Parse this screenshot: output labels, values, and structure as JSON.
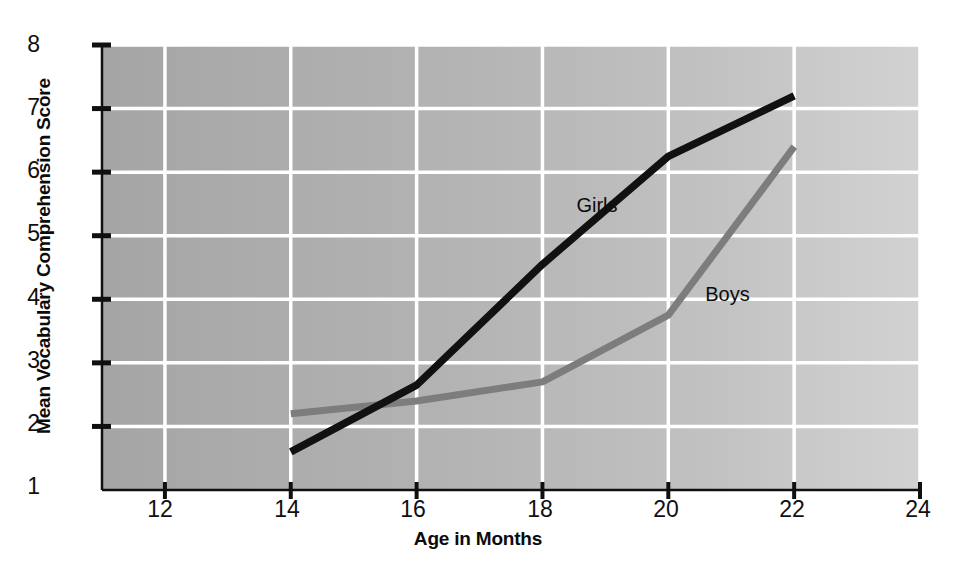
{
  "chart_data": {
    "type": "line",
    "title": "",
    "xlabel": "Age in Months",
    "ylabel": "Mean Vocabulary Comprehension Score",
    "xlim": [
      11,
      24
    ],
    "ylim": [
      1,
      8
    ],
    "xticks": [
      12,
      14,
      16,
      18,
      20,
      22,
      24
    ],
    "yticks": [
      1,
      2,
      3,
      4,
      5,
      6,
      7,
      8
    ],
    "grid": true,
    "legend_position": "inline-annotation",
    "x": [
      14,
      16,
      18,
      20,
      22
    ],
    "series": [
      {
        "name": "Girls",
        "color": "#111111",
        "values": [
          1.6,
          2.65,
          4.55,
          6.25,
          7.2
        ]
      },
      {
        "name": "Boys",
        "color": "#7d7d7d",
        "values": [
          2.2,
          2.4,
          2.7,
          3.75,
          6.4
        ]
      }
    ],
    "annotations": [
      {
        "text": "Girls",
        "x": 19.0,
        "y": 5.45
      },
      {
        "text": "Boys",
        "x": 21.0,
        "y": 4.05
      }
    ]
  },
  "axes": {
    "y_tick_labels": [
      "8",
      "7",
      "6",
      "5",
      "4",
      "3",
      "2",
      "1"
    ],
    "x_tick_labels": [
      "12",
      "14",
      "16",
      "18",
      "20",
      "22",
      "24"
    ],
    "y_title": "Mean Vocabulary Comprehension Score",
    "x_title": "Age in Months"
  },
  "style": {
    "plot_bg_left": "#a9a9a9",
    "plot_bg_right": "#cfcfcf",
    "gridline_color": "#ffffff",
    "axis_color": "#101010",
    "girls_line_color": "#111111",
    "boys_line_color": "#7d7d7d"
  }
}
